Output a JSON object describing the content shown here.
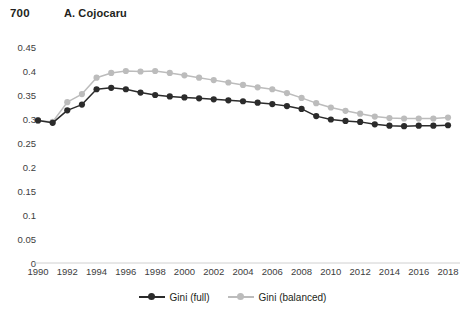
{
  "header": {
    "page_number": "700",
    "running_head": "A. Cojocaru"
  },
  "chart_data": {
    "type": "line",
    "title": "",
    "xlabel": "",
    "ylabel": "",
    "grid": false,
    "legend_position": "bottom",
    "ylim": [
      0,
      0.45
    ],
    "yticks": [
      "0",
      "0.05",
      "0.1",
      "0.15",
      "0.2",
      "0.25",
      "0.3",
      "0.35",
      "0.4",
      "0.45"
    ],
    "ytick_values": [
      0,
      0.05,
      0.1,
      0.15,
      0.2,
      0.25,
      0.3,
      0.35,
      0.4,
      0.45
    ],
    "xlim": [
      1990,
      2018
    ],
    "xticks": [
      "1990",
      "1992",
      "1994",
      "1996",
      "1998",
      "2000",
      "2002",
      "2004",
      "2006",
      "2008",
      "2010",
      "2012",
      "2014",
      "2016",
      "2018"
    ],
    "xtick_values": [
      1990,
      1992,
      1994,
      1996,
      1998,
      2000,
      2002,
      2004,
      2006,
      2008,
      2010,
      2012,
      2014,
      2016,
      2018
    ],
    "x": [
      1990,
      1991,
      1992,
      1993,
      1994,
      1995,
      1996,
      1997,
      1998,
      1999,
      2000,
      2001,
      2002,
      2003,
      2004,
      2005,
      2006,
      2007,
      2008,
      2009,
      2010,
      2011,
      2012,
      2013,
      2014,
      2015,
      2016,
      2017,
      2018
    ],
    "series": [
      {
        "name": "Gini (full)",
        "color": "#2b2b2b",
        "values": [
          0.297,
          0.292,
          0.318,
          0.33,
          0.362,
          0.365,
          0.362,
          0.355,
          0.35,
          0.347,
          0.345,
          0.343,
          0.341,
          0.339,
          0.337,
          0.334,
          0.331,
          0.327,
          0.321,
          0.306,
          0.299,
          0.296,
          0.294,
          0.289,
          0.286,
          0.285,
          0.286,
          0.286,
          0.287
        ]
      },
      {
        "name": "Gini (balanced)",
        "color": "#bcbcbc",
        "values": [
          0.297,
          0.294,
          0.335,
          0.352,
          0.386,
          0.396,
          0.4,
          0.399,
          0.4,
          0.396,
          0.391,
          0.386,
          0.381,
          0.376,
          0.371,
          0.366,
          0.362,
          0.354,
          0.344,
          0.333,
          0.324,
          0.317,
          0.311,
          0.305,
          0.302,
          0.301,
          0.301,
          0.301,
          0.303
        ]
      }
    ]
  },
  "legend": {
    "entries": [
      {
        "label": "Gini (full)"
      },
      {
        "label": "Gini (balanced)"
      }
    ]
  },
  "colors": {
    "series_full": "#2b2b2b",
    "series_balanced": "#bcbcbc",
    "axis": "#d0d0d0",
    "text": "#231f20",
    "tick_text": "#3d3d3d",
    "background": "#ffffff"
  }
}
